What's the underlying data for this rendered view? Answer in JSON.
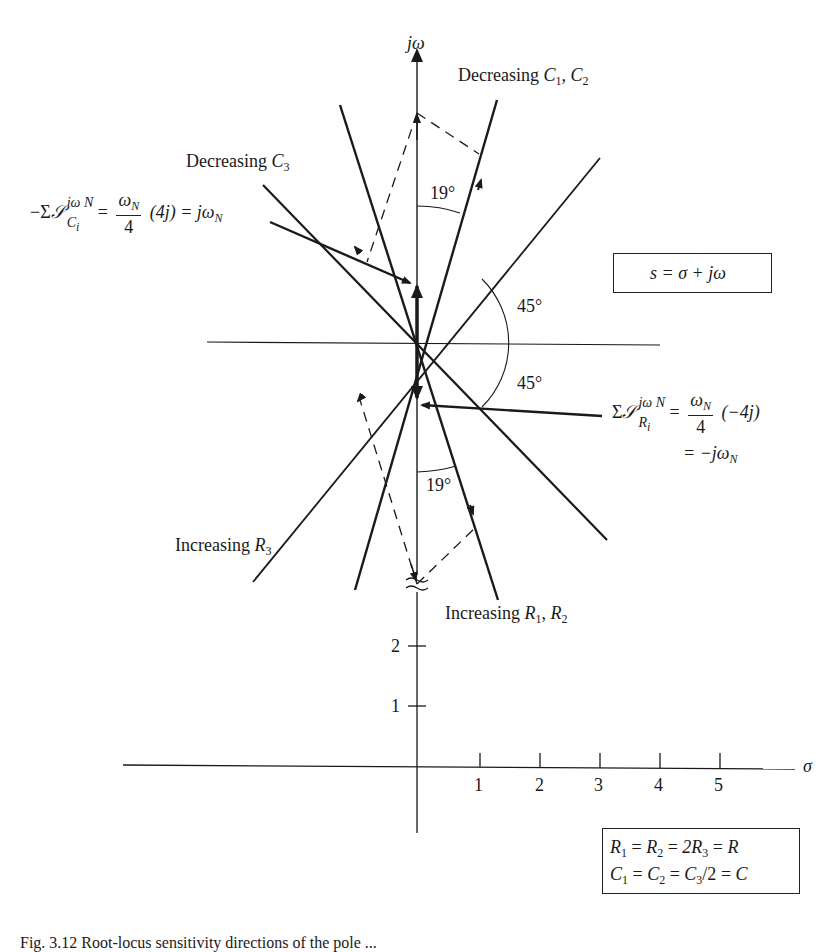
{
  "figure": {
    "type": "root-sensitivity s-plane diagram",
    "axes": {
      "vertical_label": "jω",
      "horizontal_label": "σ",
      "sigma_ticks": [
        "1",
        "2",
        "3",
        "4",
        "5"
      ],
      "jw_ticks": [
        "1",
        "2"
      ],
      "axis_break_symbol": "≈"
    },
    "labels": {
      "decreasing_c1_c2": {
        "prefix": "Decreasing ",
        "v1": "C",
        "s1": "1",
        "sep": ", ",
        "v2": "C",
        "s2": "2"
      },
      "decreasing_c3": {
        "prefix": "Decreasing ",
        "v1": "C",
        "s1": "3"
      },
      "increasing_r3": {
        "prefix": "Increasing ",
        "v1": "R",
        "s1": "3"
      },
      "increasing_r1_r2": {
        "prefix": "Increasing ",
        "v1": "R",
        "s1": "1",
        "sep": ", ",
        "v2": "R",
        "s2": "2"
      },
      "angle_upper_19": "19°",
      "angle_lower_19": "19°",
      "angle_upper_45": "45°",
      "angle_lower_45": "45°"
    },
    "equation_c": {
      "lead": "−Σ",
      "sens": "𝒮",
      "sup": "jω",
      "sup_sub": "N",
      "sub": "C",
      "sub_sub": "i",
      "eq": "=",
      "num": "ω",
      "num_sub": "N",
      "den": "4",
      "tail": "(4j) = jω",
      "tail_sub": "N"
    },
    "equation_r": {
      "lead": "Σ",
      "sens": "𝒮",
      "sup": "jω",
      "sup_sub": "N",
      "sub": "R",
      "sub_sub": "i",
      "eq": "=",
      "num": "ω",
      "num_sub": "N",
      "den": "4",
      "tail": "(−4j)",
      "line2": "= −jω",
      "line2_sub": "N"
    },
    "s_plane_box": "s = σ + jω",
    "component_box": {
      "line1": {
        "a": "R",
        "as": "1",
        "b": "R",
        "bs": "2",
        "c": "2R",
        "cs": "3",
        "d": "R"
      },
      "line2": {
        "a": "C",
        "as": "1",
        "b": "C",
        "bs": "2",
        "c": "C",
        "cs": "3",
        "c_tail": "/2",
        "d": "C"
      }
    },
    "caption": "Fig. 3.12  Root-locus sensitivity directions of the pole ..."
  }
}
